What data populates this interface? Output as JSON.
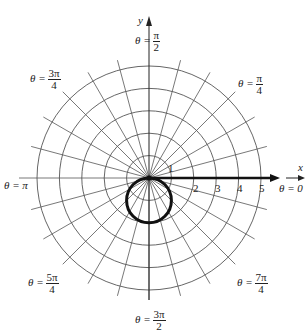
{
  "chart_data": {
    "type": "polar",
    "title": "",
    "curve": {
      "equation_implied": "circle through pole below x-axis (r = -2 sin θ)",
      "diameter": 2,
      "center_polar": {
        "r": 1,
        "theta": "3π/2"
      }
    },
    "rings": [
      1,
      2,
      3,
      4,
      5
    ],
    "radial_lines_step": "π/12",
    "axis_labels": {
      "x": "x",
      "y": "y"
    },
    "ring_tick_labels": [
      "1",
      "2",
      "3",
      "4",
      "5"
    ],
    "angle_labels": [
      {
        "id": "pi_over_2",
        "prefix": "θ =",
        "num": "π",
        "den": "2"
      },
      {
        "id": "three_pi_over_4",
        "prefix": "θ =",
        "num": "3π",
        "den": "4"
      },
      {
        "id": "pi_over_4",
        "prefix": "θ =",
        "num": "π",
        "den": "4"
      },
      {
        "id": "pi",
        "text": "θ = π"
      },
      {
        "id": "zero",
        "text": "θ = 0"
      },
      {
        "id": "five_pi_over_4",
        "prefix": "θ =",
        "num": "5π",
        "den": "4"
      },
      {
        "id": "seven_pi_over_4",
        "prefix": "θ =",
        "num": "7π",
        "den": "4"
      },
      {
        "id": "three_pi_over_2",
        "prefix": "θ =",
        "num": "3π",
        "den": "2"
      }
    ],
    "grid": true,
    "legend": null
  },
  "labels": {
    "x_axis": "x",
    "y_axis": "y",
    "ticks": [
      "1",
      "2",
      "3",
      "4",
      "5"
    ],
    "theta_prefix": "θ =",
    "pi_over_2": {
      "num": "π",
      "den": "2"
    },
    "three_pi_over_4": {
      "num": "3π",
      "den": "4"
    },
    "pi_over_4": {
      "num": "π",
      "den": "4"
    },
    "pi": "θ = π",
    "zero": "θ = 0",
    "five_pi_over_4": {
      "num": "5π",
      "den": "4"
    },
    "seven_pi_over_4": {
      "num": "7π",
      "den": "4"
    },
    "three_pi_over_2": {
      "num": "3π",
      "den": "2"
    }
  }
}
